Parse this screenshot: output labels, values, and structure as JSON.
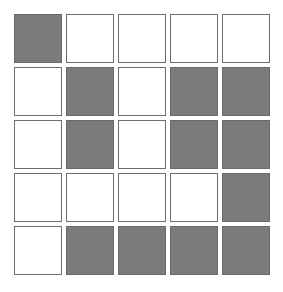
{
  "grid": {
    "rows": 5,
    "cols": 5,
    "colors": {
      "filled": "#7b7b7b",
      "empty": "#ffffff",
      "border": "#6e6e6e"
    },
    "cells": [
      [
        1,
        0,
        0,
        0,
        0
      ],
      [
        0,
        1,
        0,
        1,
        1
      ],
      [
        0,
        1,
        0,
        1,
        1
      ],
      [
        0,
        0,
        0,
        0,
        1
      ],
      [
        0,
        1,
        1,
        1,
        1
      ]
    ]
  }
}
